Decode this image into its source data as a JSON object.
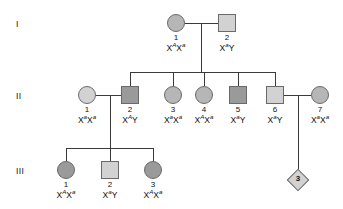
{
  "diagram": {
    "type": "pedigree",
    "title": "",
    "generation_labels": [
      {
        "id": "gen-I",
        "label": "I"
      },
      {
        "id": "gen-II",
        "label": "II"
      },
      {
        "id": "gen-III",
        "label": "III"
      }
    ],
    "legend_shading": {
      "light": "#d2d2d2",
      "medium": "#b6b6b6",
      "dark": "#9a9a9a",
      "outline": "#6a6a6a"
    },
    "individuals": [
      {
        "key": "I-1",
        "generation": "I",
        "number": "1",
        "sex": "female",
        "shape": "circle",
        "shading": "medium",
        "allele1": "X",
        "sup1": "A",
        "allele2": "X",
        "sup2": "a",
        "x": 176,
        "y": 23
      },
      {
        "key": "I-2",
        "generation": "I",
        "number": "2",
        "sex": "male",
        "shape": "square",
        "shading": "light",
        "allele1": "X",
        "sup1": "a",
        "allele2": "Y",
        "sup2": "",
        "x": 227,
        "y": 23
      },
      {
        "key": "II-1",
        "generation": "II",
        "number": "1",
        "sex": "female",
        "shape": "circle",
        "shading": "light",
        "allele1": "X",
        "sup1": "a",
        "allele2": "X",
        "sup2": "a",
        "x": 87,
        "y": 95
      },
      {
        "key": "II-2",
        "generation": "II",
        "number": "2",
        "sex": "male",
        "shape": "square",
        "shading": "dark",
        "allele1": "X",
        "sup1": "A",
        "allele2": "Y",
        "sup2": "",
        "x": 130,
        "y": 95
      },
      {
        "key": "II-3",
        "generation": "II",
        "number": "3",
        "sex": "female",
        "shape": "circle",
        "shading": "medium",
        "allele1": "X",
        "sup1": "a",
        "allele2": "X",
        "sup2": "a",
        "x": 173,
        "y": 95
      },
      {
        "key": "II-4",
        "generation": "II",
        "number": "4",
        "sex": "female",
        "shape": "circle",
        "shading": "medium",
        "allele1": "X",
        "sup1": "A",
        "allele2": "X",
        "sup2": "a",
        "x": 204,
        "y": 95
      },
      {
        "key": "II-5",
        "generation": "II",
        "number": "5",
        "sex": "male",
        "shape": "square",
        "shading": "dark",
        "allele1": "X",
        "sup1": "a",
        "allele2": "Y",
        "sup2": "",
        "x": 238,
        "y": 95
      },
      {
        "key": "II-6",
        "generation": "II",
        "number": "6",
        "sex": "male",
        "shape": "square",
        "shading": "light",
        "allele1": "X",
        "sup1": "a",
        "allele2": "Y",
        "sup2": "",
        "x": 275,
        "y": 95
      },
      {
        "key": "II-7",
        "generation": "II",
        "number": "7",
        "sex": "female",
        "shape": "circle",
        "shading": "medium",
        "allele1": "X",
        "sup1": "a",
        "allele2": "X",
        "sup2": "a",
        "x": 320,
        "y": 95
      },
      {
        "key": "III-1",
        "generation": "III",
        "number": "1",
        "sex": "female",
        "shape": "circle",
        "shading": "dark",
        "allele1": "X",
        "sup1": "A",
        "allele2": "X",
        "sup2": "a",
        "x": 66,
        "y": 170
      },
      {
        "key": "III-2",
        "generation": "III",
        "number": "2",
        "sex": "male",
        "shape": "square",
        "shading": "light",
        "allele1": "X",
        "sup1": "a",
        "allele2": "Y",
        "sup2": "",
        "x": 110,
        "y": 170
      },
      {
        "key": "III-3",
        "generation": "III",
        "number": "3",
        "sex": "female",
        "shape": "circle",
        "shading": "dark",
        "allele1": "X",
        "sup1": "A",
        "allele2": "X",
        "sup2": "a",
        "x": 153,
        "y": 170
      }
    ],
    "sibship_group": {
      "key": "III-diamond",
      "shape": "diamond",
      "shading": "light",
      "count": "3",
      "x": 298,
      "y": 180
    }
  }
}
